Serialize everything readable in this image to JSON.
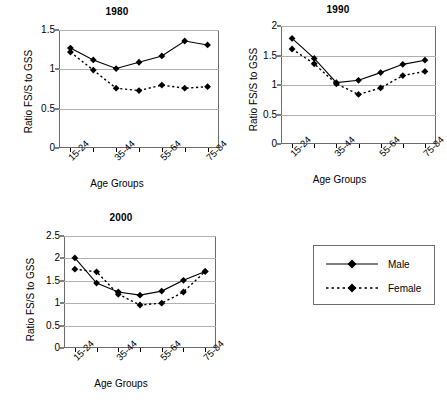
{
  "figure": {
    "axis_label_y": "Ratio FS/S to GSS",
    "axis_label_x": "Age Groups"
  },
  "legend": {
    "male_label": "Male",
    "female_label": "Female"
  },
  "colors": {
    "series": "#000000",
    "grid": "#b0b0b0",
    "frame": "#6b6b6b"
  },
  "chart_data": [
    {
      "type": "line",
      "title": "1980",
      "xlabel": "Age Groups",
      "ylabel": "Ratio FS/S to GSS",
      "categories": [
        "15-24",
        "25-34",
        "35-44",
        "45-54",
        "55-64",
        "65-74",
        "75-84"
      ],
      "tick_labels_shown": [
        "15-24",
        "",
        "35-44",
        "",
        "55-64",
        "",
        "75-84"
      ],
      "ylim": [
        0,
        1.5
      ],
      "yticks": [
        0,
        0.5,
        1,
        1.5
      ],
      "ytick_labels": [
        "0",
        "0.5",
        "1",
        "1.5"
      ],
      "grid": true,
      "legend_position": "external-right",
      "series": [
        {
          "name": "Male",
          "style": "solid",
          "marker": "diamond",
          "values": [
            1.27,
            1.12,
            1.01,
            1.09,
            1.17,
            1.36,
            1.31
          ]
        },
        {
          "name": "Female",
          "style": "dotted",
          "marker": "diamond",
          "values": [
            1.22,
            0.99,
            0.76,
            0.73,
            0.8,
            0.76,
            0.78
          ]
        }
      ]
    },
    {
      "type": "line",
      "title": "1990",
      "xlabel": "Age Groups",
      "ylabel": "Ratio FS/S to GSS",
      "categories": [
        "15-24",
        "25-34",
        "35-44",
        "45-54",
        "55-64",
        "65-74",
        "75-84"
      ],
      "tick_labels_shown": [
        "15-24",
        "",
        "35-44",
        "",
        "55-64",
        "",
        "75-84"
      ],
      "ylim": [
        0,
        2
      ],
      "yticks": [
        0,
        0.5,
        1,
        1.5,
        2
      ],
      "ytick_labels": [
        "0",
        "0.5",
        "1",
        "1.5",
        "2"
      ],
      "grid": true,
      "legend_position": "external-right",
      "series": [
        {
          "name": "Male",
          "style": "solid",
          "marker": "diamond",
          "values": [
            1.79,
            1.45,
            1.04,
            1.08,
            1.21,
            1.35,
            1.42
          ]
        },
        {
          "name": "Female",
          "style": "dotted",
          "marker": "diamond",
          "values": [
            1.61,
            1.36,
            1.02,
            0.84,
            0.95,
            1.16,
            1.23
          ]
        }
      ]
    },
    {
      "type": "line",
      "title": "2000",
      "xlabel": "Age Groups",
      "ylabel": "Ratio FS/S to GSS",
      "categories": [
        "15-24",
        "25-34",
        "35-44",
        "45-54",
        "55-64",
        "65-74",
        "75-84"
      ],
      "tick_labels_shown": [
        "15-24",
        "",
        "35-44",
        "",
        "55-64",
        "",
        "75-84"
      ],
      "ylim": [
        0,
        2.5
      ],
      "yticks": [
        0,
        0.5,
        1,
        1.5,
        2,
        2.5
      ],
      "ytick_labels": [
        "0",
        "0.5",
        "1",
        "1.5",
        "2",
        "2.5"
      ],
      "grid": true,
      "legend_position": "external-right",
      "series": [
        {
          "name": "Male",
          "style": "solid",
          "marker": "diamond",
          "values": [
            2.01,
            1.45,
            1.25,
            1.18,
            1.27,
            1.51,
            1.71
          ]
        },
        {
          "name": "Female",
          "style": "dotted",
          "marker": "diamond",
          "values": [
            1.76,
            1.7,
            1.2,
            0.96,
            1.0,
            1.25,
            1.71
          ]
        }
      ]
    }
  ]
}
